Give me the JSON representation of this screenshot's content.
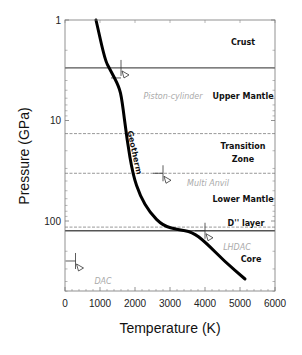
{
  "chart_data": {
    "type": "line",
    "title": "",
    "xlabel": "Temperature (K)",
    "ylabel": "Pressure (GPa)",
    "xlim": [
      0,
      6000
    ],
    "ylim": [
      1,
      500
    ],
    "yscale": "log",
    "y_inverted": true,
    "grid": false,
    "x_ticks": [
      0,
      1000,
      2000,
      3000,
      4000,
      5000,
      6000
    ],
    "x_tick_labels": [
      "0",
      "1000",
      "2000",
      "3000",
      "4000",
      "5000",
      "6000"
    ],
    "y_ticks": [
      1,
      10,
      100
    ],
    "y_tick_labels": [
      "1",
      "10",
      "100"
    ],
    "series": [
      {
        "name": "Geotherm",
        "color": "#000000",
        "x": [
          886,
          1143,
          1286,
          1543,
          1629,
          1771,
          1943,
          2143,
          2429,
          2800,
          3229,
          3629,
          4000,
          4571,
          5143
        ],
        "y": [
          1,
          2.5,
          3.1,
          4.6,
          6.2,
          15.6,
          34.8,
          56,
          83,
          112,
          122,
          128,
          161,
          255,
          378
        ]
      }
    ],
    "boundaries": [
      {
        "name": "crust-mantle",
        "pressure": 3.0,
        "style": "solid"
      },
      {
        "name": "upper-mantle-transition-zone",
        "pressure": 13.5,
        "style": "dashed"
      },
      {
        "name": "transition-zone-lower-mantle",
        "pressure": 33.5,
        "style": "dashed"
      },
      {
        "name": "d-double-prime",
        "pressure": 115,
        "style": "dashed"
      },
      {
        "name": "core-mantle",
        "pressure": 125,
        "style": "solid"
      }
    ],
    "annotations": [
      {
        "text": "Crust",
        "kind": "layer",
        "x_px": 243,
        "y_px": 45
      },
      {
        "text": "Upper Mantle",
        "kind": "layer",
        "x_px": 243,
        "y_px": 99
      },
      {
        "text": "Transition",
        "kind": "layer",
        "x_px": 243,
        "y_px": 149
      },
      {
        "text": "Zone",
        "kind": "layer",
        "x_px": 243,
        "y_px": 162
      },
      {
        "text": "Lower Mantle",
        "kind": "layer",
        "x_px": 243,
        "y_px": 202
      },
      {
        "text": "D'' layer",
        "kind": "layer",
        "x_px": 246,
        "y_px": 226
      },
      {
        "text": "Core",
        "kind": "layer",
        "x_px": 251,
        "y_px": 262
      },
      {
        "text": "Piston-cylinder",
        "kind": "technique",
        "x_px": 173,
        "y_px": 99
      },
      {
        "text": "Multi Anvil",
        "kind": "technique",
        "x_px": 208,
        "y_px": 186
      },
      {
        "text": "LHDAC",
        "kind": "technique",
        "x_px": 237,
        "y_px": 250
      },
      {
        "text": "DAC",
        "kind": "technique",
        "x_px": 103,
        "y_px": 284
      },
      {
        "text": "Geotherm",
        "kind": "curve-label",
        "x_px": 132,
        "y_px": 153,
        "rotate": 78
      }
    ],
    "markers": [
      {
        "name": "piston-cylinder-marker",
        "pressure": 3.0,
        "temperature": 1600
      },
      {
        "name": "multi-anvil-marker",
        "pressure": 33.5,
        "temperature": 2800
      },
      {
        "name": "lhdac-marker",
        "pressure": 125,
        "temperature": 4000
      },
      {
        "name": "dac-marker",
        "pressure": 250,
        "temperature": 300
      }
    ]
  }
}
